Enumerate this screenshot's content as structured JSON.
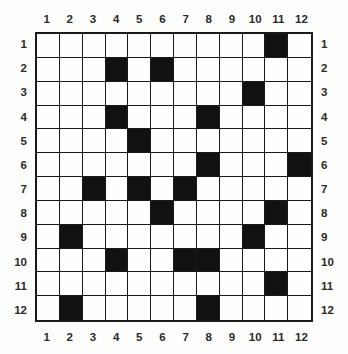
{
  "grid": {
    "rows": 12,
    "columns": 12,
    "fill_color": "#111111",
    "empty_color": "#fefefe",
    "line_color": "#1a1a1a",
    "column_labels_top": [
      "1",
      "2",
      "3",
      "4",
      "5",
      "6",
      "7",
      "8",
      "9",
      "10",
      "11",
      "12"
    ],
    "column_labels_bottom": [
      "1",
      "2",
      "3",
      "4",
      "5",
      "6",
      "7",
      "8",
      "9",
      "10",
      "11",
      "12"
    ],
    "row_labels_left": [
      "1",
      "2",
      "3",
      "4",
      "5",
      "6",
      "7",
      "8",
      "9",
      "10",
      "11",
      "12"
    ],
    "row_labels_right": [
      "1",
      "2",
      "3",
      "4",
      "5",
      "6",
      "7",
      "8",
      "9",
      "10",
      "11",
      "12"
    ]
  },
  "chart_data": {
    "type": "heatmap",
    "title": "",
    "xlabel": "",
    "ylabel": "",
    "categories": [
      "1",
      "2",
      "3",
      "4",
      "5",
      "6",
      "7",
      "8",
      "9",
      "10",
      "11",
      "12"
    ],
    "row_categories": [
      "1",
      "2",
      "3",
      "4",
      "5",
      "6",
      "7",
      "8",
      "9",
      "10",
      "11",
      "12"
    ],
    "legend": [],
    "grid": true,
    "values": [
      [
        0,
        0,
        0,
        0,
        0,
        0,
        0,
        0,
        0,
        0,
        1,
        0
      ],
      [
        0,
        0,
        0,
        1,
        0,
        1,
        0,
        0,
        0,
        0,
        0,
        0
      ],
      [
        0,
        0,
        0,
        0,
        0,
        0,
        0,
        0,
        0,
        1,
        0,
        0
      ],
      [
        0,
        0,
        0,
        1,
        0,
        0,
        0,
        1,
        0,
        0,
        0,
        0
      ],
      [
        0,
        0,
        0,
        0,
        1,
        0,
        0,
        0,
        0,
        0,
        0,
        0
      ],
      [
        0,
        0,
        0,
        0,
        0,
        0,
        0,
        1,
        0,
        0,
        0,
        1
      ],
      [
        0,
        0,
        1,
        0,
        1,
        0,
        1,
        0,
        0,
        0,
        0,
        0
      ],
      [
        0,
        0,
        0,
        0,
        0,
        1,
        0,
        0,
        0,
        0,
        1,
        0
      ],
      [
        0,
        1,
        0,
        0,
        0,
        0,
        0,
        0,
        0,
        1,
        0,
        0
      ],
      [
        0,
        0,
        0,
        1,
        0,
        0,
        1,
        1,
        0,
        0,
        0,
        0
      ],
      [
        0,
        0,
        0,
        0,
        0,
        0,
        0,
        0,
        0,
        0,
        1,
        0
      ],
      [
        0,
        1,
        0,
        0,
        0,
        0,
        0,
        1,
        0,
        0,
        0,
        0
      ]
    ],
    "filled_cells": [
      {
        "row": 1,
        "columns": [
          11
        ]
      },
      {
        "row": 2,
        "columns": [
          4,
          6
        ]
      },
      {
        "row": 3,
        "columns": [
          10
        ]
      },
      {
        "row": 4,
        "columns": [
          4,
          8
        ]
      },
      {
        "row": 5,
        "columns": [
          5
        ]
      },
      {
        "row": 6,
        "columns": [
          8,
          12
        ]
      },
      {
        "row": 7,
        "columns": [
          3,
          5,
          7
        ]
      },
      {
        "row": 8,
        "columns": [
          6,
          11
        ]
      },
      {
        "row": 9,
        "columns": [
          2,
          10
        ]
      },
      {
        "row": 10,
        "columns": [
          4,
          7,
          8
        ]
      },
      {
        "row": 11,
        "columns": [
          11
        ]
      },
      {
        "row": 12,
        "columns": [
          2,
          8
        ]
      }
    ],
    "filled_count": 21
  }
}
